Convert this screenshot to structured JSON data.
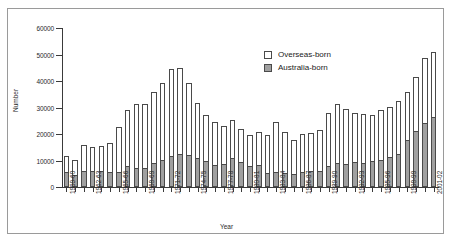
{
  "figure": {
    "ylabel": "Number",
    "xlabel": "Year"
  },
  "legend": {
    "items": [
      {
        "label": "Overseas-born",
        "color": "#ffffff",
        "swatch": "legend-swatch-overseas"
      },
      {
        "label": "Australia-born",
        "color": "#a0a0a0",
        "swatch": "legend-swatch-australia"
      }
    ]
  },
  "chart_data": {
    "type": "bar",
    "stacked": true,
    "title": "",
    "subtitle": "",
    "xlabel": "Year",
    "ylabel": "Number",
    "ylim": [
      0,
      60000
    ],
    "ytick_labels": [
      "0",
      "10000",
      "20000",
      "30000",
      "40000",
      "50000",
      "60000"
    ],
    "ytick_values": [
      0,
      10000,
      20000,
      30000,
      40000,
      50000,
      60000
    ],
    "grid": false,
    "legend_position": "upper-center-right",
    "categories": [
      "1959-60",
      "1960-61",
      "1961-62",
      "1962-63",
      "1963-64",
      "1964-65",
      "1965-66",
      "1966-67",
      "1967-68",
      "1968-69",
      "1969-70",
      "1970-71",
      "1971-72",
      "1972-73",
      "1973-74",
      "1974-75",
      "1975-76",
      "1976-77",
      "1977-78",
      "1978-79",
      "1979-80",
      "1980-81",
      "1981-82",
      "1982-83",
      "1983-84",
      "1984-85",
      "1985-86",
      "1986-87",
      "1987-88",
      "1988-89",
      "1989-90",
      "1990-91",
      "1991-92",
      "1992-93",
      "1993-94",
      "1994-95",
      "1995-96",
      "1996-97",
      "1997-98",
      "1998-99",
      "1999-00",
      "2000-01",
      "2001-02"
    ],
    "xtick_labels_shown": [
      "1959-60",
      "1962-63",
      "1965-66",
      "1968-69",
      "1971-72",
      "1974-75",
      "1977-78",
      "1980-81",
      "1983-84",
      "1986-87",
      "1989-90",
      "1992-93",
      "1995-96",
      "1998-99",
      "2001-02"
    ],
    "series": [
      {
        "name": "Australia-born",
        "color": "#a0a0a0",
        "values": [
          5500,
          4400,
          6200,
          5900,
          6200,
          5800,
          5600,
          8000,
          7000,
          7300,
          9000,
          10300,
          11800,
          12300,
          12200,
          10900,
          9700,
          8400,
          8500,
          11000,
          9400,
          8100,
          8400,
          5400,
          5800,
          5400,
          5100,
          5700,
          6100,
          6200,
          7900,
          9000,
          8800,
          9400,
          9200,
          9700,
          10100,
          11500,
          12600,
          17700,
          21000,
          24000,
          26300
        ]
      },
      {
        "name": "Overseas-born",
        "color": "#ffffff",
        "values": [
          6300,
          5800,
          9700,
          9100,
          9300,
          10900,
          17000,
          21100,
          24400,
          24200,
          26800,
          29100,
          32600,
          32500,
          27100,
          20700,
          17500,
          16000,
          14400,
          14400,
          12500,
          11500,
          12500,
          14300,
          18600,
          15300,
          12800,
          14300,
          14400,
          15500,
          20200,
          22500,
          20800,
          18600,
          18300,
          17400,
          18900,
          18800,
          20000,
          18100,
          20600,
          24800,
          24800
        ]
      }
    ],
    "totals": [
      11800,
      10200,
      15900,
      15000,
      15500,
      16700,
      22600,
      29100,
      31400,
      31500,
      35800,
      39400,
      44400,
      44800,
      39300,
      31600,
      27200,
      24400,
      22900,
      25400,
      21900,
      19600,
      20900,
      19700,
      24400,
      20700,
      17900,
      20000,
      20500,
      21700,
      28100,
      31500,
      29600,
      28000,
      27500,
      27100,
      29000,
      30300,
      32600,
      35800,
      41600,
      48800,
      51100
    ]
  }
}
